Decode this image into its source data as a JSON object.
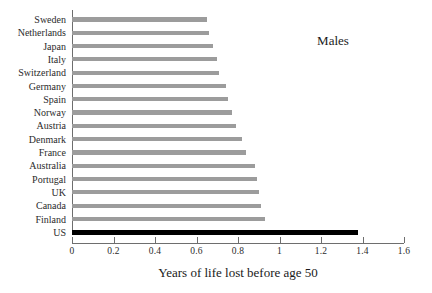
{
  "chart_data": {
    "type": "bar",
    "orientation": "horizontal",
    "title": "",
    "annotation": "Males",
    "xlabel": "Years of life lost before age 50",
    "ylabel": "",
    "xlim": [
      0,
      1.6
    ],
    "xticks": [
      0,
      0.2,
      0.4,
      0.6,
      0.8,
      1,
      1.2,
      1.4,
      1.6
    ],
    "xticklabels": [
      "0",
      "0.2",
      "0.4",
      "0.6",
      "0.8",
      "1",
      "1.2",
      "1.4",
      "1.6"
    ],
    "grid": false,
    "legend": null,
    "bar_color": "#9c9c9c",
    "highlight_color": "#000000",
    "highlight_category": "US",
    "categories": [
      "Sweden",
      "Netherlands",
      "Japan",
      "Italy",
      "Switzerland",
      "Germany",
      "Spain",
      "Norway",
      "Austria",
      "Denmark",
      "France",
      "Australia",
      "Portugal",
      "UK",
      "Canada",
      "Finland",
      "US"
    ],
    "values": [
      0.65,
      0.66,
      0.68,
      0.7,
      0.71,
      0.74,
      0.75,
      0.77,
      0.79,
      0.82,
      0.84,
      0.88,
      0.89,
      0.9,
      0.91,
      0.93,
      1.38
    ]
  }
}
